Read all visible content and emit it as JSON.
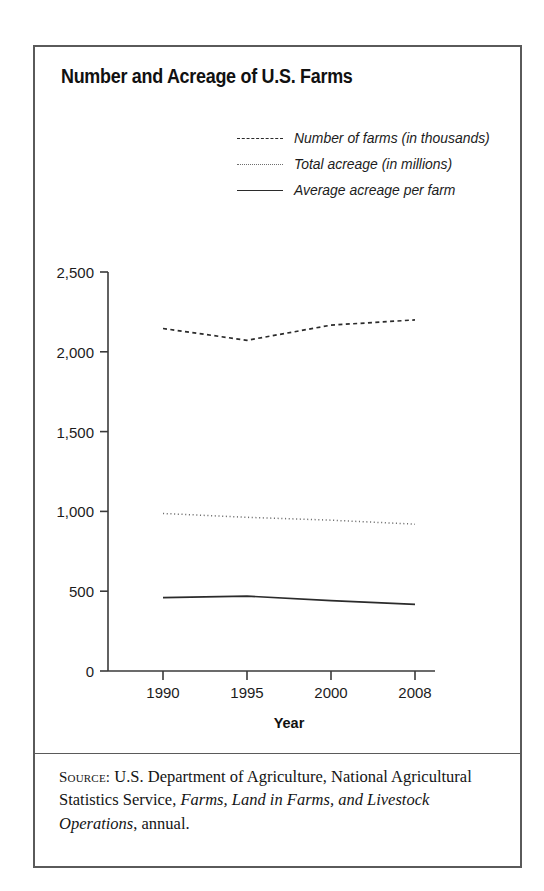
{
  "figure": {
    "title": "Number and Acreage of U.S. Farms",
    "x_axis_title": "Year",
    "source": {
      "kicker": "Source:",
      "text_before": " U.S. Department of Agriculture, National Agricultural Statistics Service, ",
      "publication": "Farms, Land in Farms, and Livestock Operations",
      "text_after": ", annual."
    }
  },
  "legend": {
    "items": [
      {
        "label": "Number of farms (in thousands)",
        "style": "dashed",
        "swatch_name": "legend-swatch-dashed"
      },
      {
        "label": "Total acreage (in millions)",
        "style": "dotted",
        "swatch_name": "legend-swatch-dotted"
      },
      {
        "label": "Average acreage per farm",
        "style": "solid",
        "swatch_name": "legend-swatch-solid"
      }
    ]
  },
  "chart_data": {
    "type": "line",
    "title": "Number and Acreage of U.S. Farms",
    "xlabel": "Year",
    "ylabel": "",
    "categories": [
      "1990",
      "1995",
      "2000",
      "2008"
    ],
    "x_tick_positions": [
      0,
      1,
      2,
      3
    ],
    "ylim": [
      0,
      2500
    ],
    "yticks": [
      0,
      500,
      1000,
      1500,
      2000,
      2500
    ],
    "ytick_labels": [
      "0",
      "500",
      "1,000",
      "1,500",
      "2,000",
      "2,500"
    ],
    "grid": false,
    "legend_position": "top-right",
    "series": [
      {
        "name": "Number of farms (in thousands)",
        "style": "dashed",
        "color": "#2b2b2b",
        "values": [
          2146,
          2072,
          2167,
          2200
        ]
      },
      {
        "name": "Total acreage (in millions)",
        "style": "dotted",
        "color": "#6e6e6e",
        "values": [
          987,
          963,
          945,
          920
        ]
      },
      {
        "name": "Average acreage per farm",
        "style": "solid",
        "color": "#2b2b2b",
        "values": [
          460,
          469,
          441,
          418
        ]
      }
    ]
  },
  "colors": {
    "frame": "#5a5a5a",
    "axis": "#3a3a3a",
    "text": "#1a1a1a"
  }
}
